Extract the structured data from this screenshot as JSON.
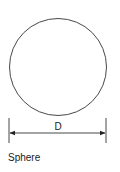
{
  "diagram": {
    "shape": "circle",
    "dimension_label": "D",
    "caption": "Sphere",
    "colors": {
      "stroke": "#333333",
      "background": "#ffffff"
    }
  }
}
